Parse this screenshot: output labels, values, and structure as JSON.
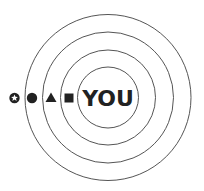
{
  "diagram": {
    "type": "concentric-circles",
    "center_label": "YOU",
    "rings": 4,
    "stroke_color": "#555555",
    "ink_color": "#222222",
    "markers": [
      {
        "icon": "star-badge-icon",
        "shape": "circle-with-star"
      },
      {
        "icon": "circle-icon",
        "shape": "filled-circle"
      },
      {
        "icon": "triangle-icon",
        "shape": "filled-triangle"
      },
      {
        "icon": "square-icon",
        "shape": "filled-square"
      }
    ]
  }
}
